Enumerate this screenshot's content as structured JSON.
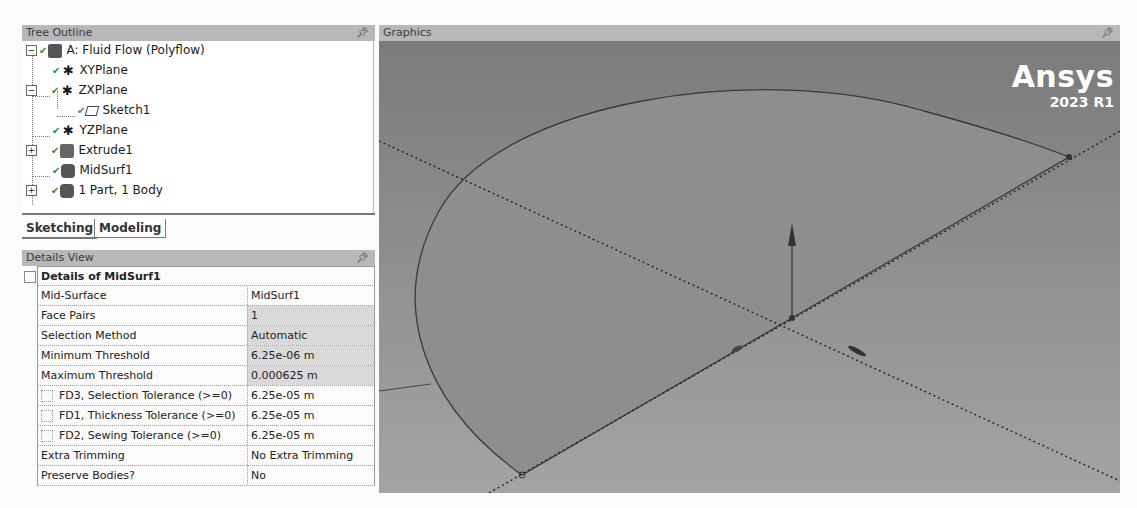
{
  "tree_outline": {
    "title": "Tree Outline",
    "items": [
      {
        "label": "A: Fluid Flow (Polyflow)",
        "icon": "geometry-root-icon",
        "expander": "minus"
      },
      {
        "label": "XYPlane",
        "icon": "plane-icon"
      },
      {
        "label": "ZXPlane",
        "icon": "plane-icon",
        "expander": "minus"
      },
      {
        "label": "Sketch1",
        "icon": "sketch-icon"
      },
      {
        "label": "YZPlane",
        "icon": "plane-icon"
      },
      {
        "label": "Extrude1",
        "icon": "extrude-icon",
        "expander": "plus"
      },
      {
        "label": "MidSurf1",
        "icon": "midsurface-icon"
      },
      {
        "label": "1 Part, 1 Body",
        "icon": "part-body-icon",
        "expander": "plus"
      }
    ]
  },
  "tabs": {
    "sketching": "Sketching",
    "modeling": "Modeling",
    "active": "Modeling"
  },
  "details_view": {
    "title": "Details View",
    "group": "Details of MidSurf1",
    "rows": [
      {
        "label": "Mid-Surface",
        "value": "MidSurf1"
      },
      {
        "label": "Face Pairs",
        "value": "1"
      },
      {
        "label": "Selection Method",
        "value": "Automatic"
      },
      {
        "label": "Minimum Threshold",
        "value": "6.25e-06 m"
      },
      {
        "label": "Maximum Threshold",
        "value": "0.000625 m"
      },
      {
        "label": "FD3, Selection Tolerance (>=0)",
        "value": "6.25e-05 m",
        "checkbox": true
      },
      {
        "label": "FD1, Thickness Tolerance (>=0)",
        "value": "6.25e-05 m",
        "checkbox": true
      },
      {
        "label": "FD2, Sewing Tolerance (>=0)",
        "value": "6.25e-05 m",
        "checkbox": true
      },
      {
        "label": "Extra Trimming",
        "value": "No Extra Trimming"
      },
      {
        "label": "Preserve Bodies?",
        "value": "No"
      }
    ]
  },
  "graphics": {
    "title": "Graphics",
    "logo_brand": "Ansys",
    "logo_version": "2023 R1"
  },
  "colors": {
    "viewport_bg": "#8a8a8a",
    "header_bg": "#b8b8b8",
    "value_grey": "#d9d9d9"
  }
}
